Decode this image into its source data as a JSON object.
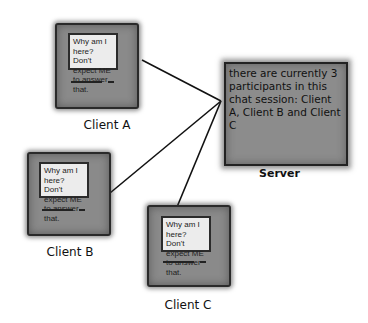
{
  "diagram": {
    "type": "client-server chat",
    "clients": [
      {
        "id": "A",
        "label": "Client A",
        "screen_text": "Why am I here?  Don't expect ME to answer that."
      },
      {
        "id": "B",
        "label": "Client B",
        "screen_text": "Why am I here?  Don't expect ME to answer that."
      },
      {
        "id": "C",
        "label": "Client C",
        "screen_text": "Why am I here?  Don't expect ME to answer that."
      }
    ],
    "server": {
      "label": "Server",
      "message": "there are currently 3 participants in this chat session: Client A, Client B and Client C"
    },
    "connections": [
      {
        "from": "Client A",
        "to": "Server"
      },
      {
        "from": "Client B",
        "to": "Server"
      },
      {
        "from": "Client C",
        "to": "Server"
      }
    ],
    "colors": {
      "box": "#8a8a8a",
      "screen": "#ececec",
      "outline": "#222222",
      "line": "#111111"
    }
  }
}
